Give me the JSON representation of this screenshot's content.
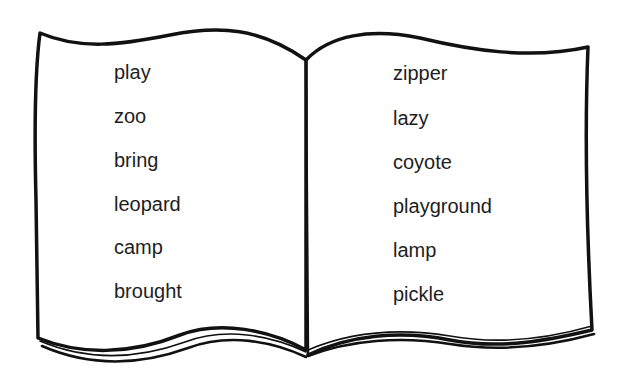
{
  "book": {
    "left_page": {
      "words": [
        "play",
        "zoo",
        "bring",
        "leopard",
        "camp",
        "brought"
      ]
    },
    "right_page": {
      "words": [
        "zipper",
        "lazy",
        "coyote",
        "playground",
        "lamp",
        "pickle"
      ]
    }
  }
}
